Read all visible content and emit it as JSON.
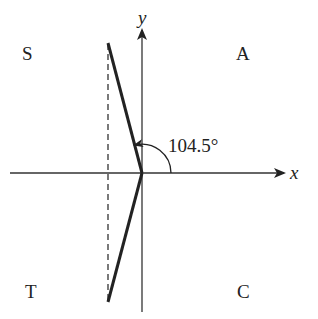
{
  "diagram": {
    "type": "unit-circle-quadrant-diagram",
    "axes": {
      "x_label": "x",
      "y_label": "y"
    },
    "quadrants": {
      "top_left": "S",
      "top_right": "A",
      "bottom_left": "T",
      "bottom_right": "C"
    },
    "angle": {
      "label": "104.5°",
      "value_degrees": 104.5
    },
    "colors": {
      "line": "#222222",
      "background": "#ffffff"
    }
  }
}
